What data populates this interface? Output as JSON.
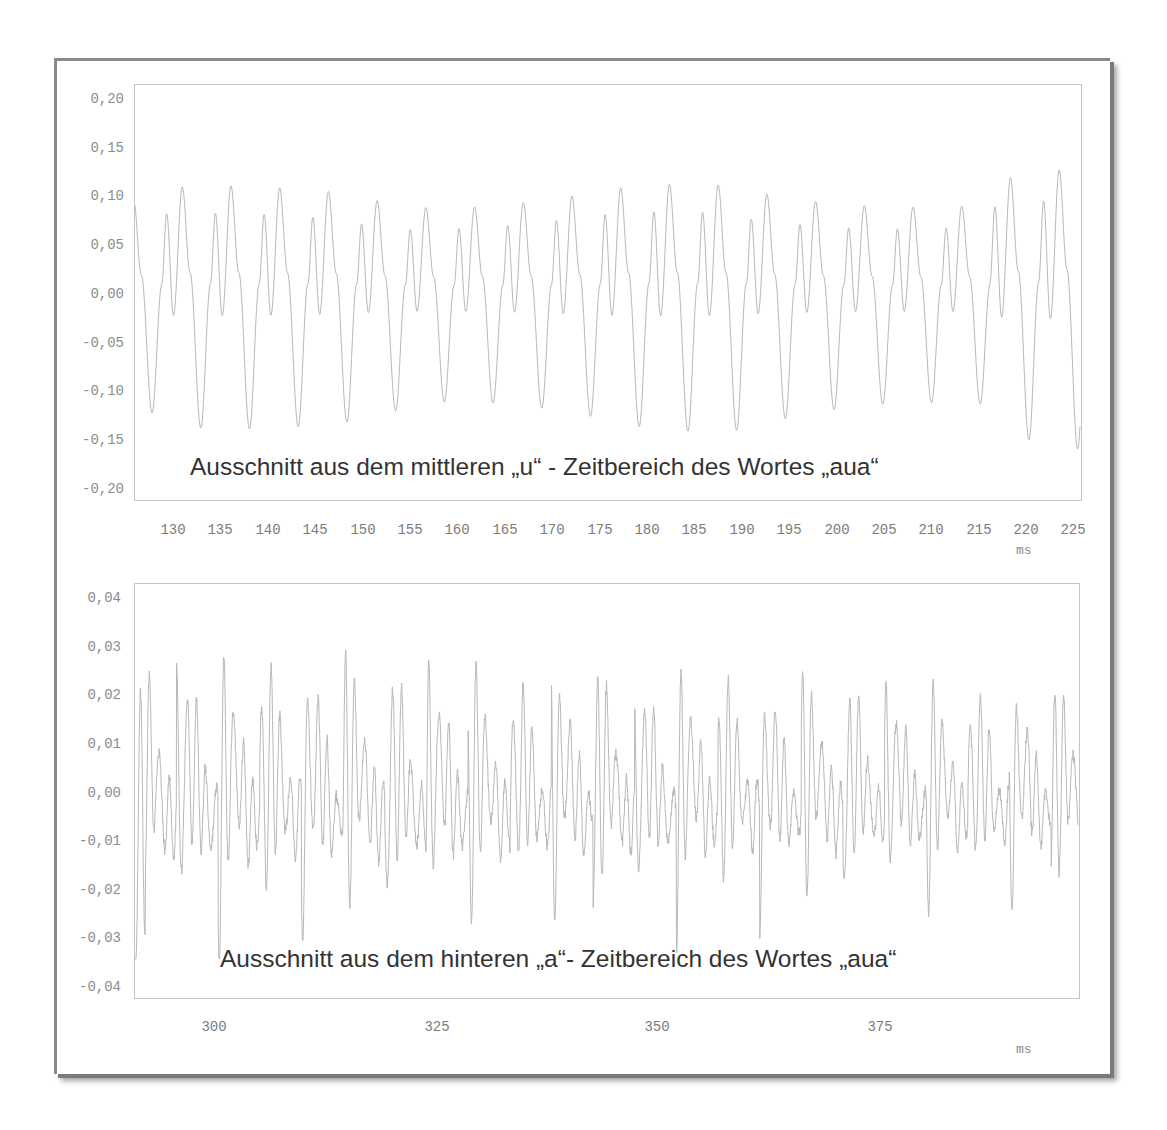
{
  "chart_data": [
    {
      "type": "line",
      "title": "Ausschnitt aus dem mittleren „u“ - Zeitbereich des Wortes „aua“",
      "xlabel": "ms",
      "ylabel": "",
      "xlim": [
        125.9,
        225.8
      ],
      "ylim": [
        -0.2,
        0.2
      ],
      "grid": false,
      "legend": "none",
      "x_ticks": [
        130,
        135,
        140,
        145,
        150,
        155,
        160,
        165,
        170,
        175,
        180,
        185,
        190,
        195,
        200,
        205,
        210,
        215,
        220,
        225
      ],
      "y_ticks": [
        0.2,
        0.15,
        0.1,
        0.05,
        0.0,
        -0.05,
        -0.1,
        -0.15,
        -0.2
      ],
      "y_tick_labels": [
        "0,20",
        "0,15",
        "0,10",
        "0,05",
        "0,00",
        "-0,05",
        "-0,10",
        "-0,15",
        "-0,20"
      ],
      "x_tick_labels": [
        "130",
        "135",
        "140",
        "145",
        "150",
        "155",
        "160",
        "165",
        "170",
        "175",
        "180",
        "185",
        "190",
        "195",
        "200",
        "205",
        "210",
        "215",
        "220",
        "225"
      ],
      "series": [
        {
          "name": "u-waveform",
          "description": "periodic vowel waveform, ~5.1 ms period (~195 Hz); per period: small peak ~0.075, large peak ~0.10, shallow dip ~-0.02, deep trough ~-0.125",
          "period_ms": 5.15,
          "small_peak": 0.075,
          "large_peak": 0.1,
          "shallow_dip": -0.02,
          "deep_trough": -0.125,
          "peak_range": [
            0.07,
            0.13
          ],
          "trough_range": [
            -0.16,
            -0.1
          ],
          "color": "#b8b8b8"
        }
      ]
    },
    {
      "type": "line",
      "title": "Ausschnitt aus dem hinteren „a“- Zeitbereich des Wortes „aua“",
      "xlabel": "ms",
      "ylabel": "",
      "xlim": [
        290.8,
        399.5
      ],
      "ylim": [
        -0.04,
        0.04
      ],
      "grid": false,
      "legend": "none",
      "x_ticks": [
        300,
        325,
        350,
        375
      ],
      "x_tick_labels": [
        "300",
        "325",
        "350",
        "375"
      ],
      "y_ticks": [
        0.04,
        0.03,
        0.02,
        0.01,
        0.0,
        -0.01,
        -0.02,
        -0.03,
        -0.04
      ],
      "y_tick_labels": [
        "0,04",
        "0,03",
        "0,02",
        "0,01",
        "0,00",
        "-0,01",
        "-0,02",
        "-0,03",
        "-0,04"
      ],
      "series": [
        {
          "name": "a-waveform",
          "description": "dense periodic vowel waveform, ~4.8 ms fundamental period (~207 Hz) with strong high-frequency formant oscillations (~900 Hz); peaks ~0.02–0.035, troughs ~-0.015 to -0.033",
          "period_ms": 4.8,
          "formant_hz": 900,
          "peak_range": [
            0.018,
            0.035
          ],
          "trough_range": [
            -0.033,
            -0.012
          ],
          "color": "#b8b8b8"
        }
      ]
    }
  ],
  "charts": {
    "top": {
      "caption": "Ausschnitt aus dem mittleren „u“ - Zeitbereich des Wortes „aua“",
      "unit": "ms",
      "y_labels": [
        "0,20",
        "0,15",
        "0,10",
        "0,05",
        "0,00",
        "-0,05",
        "-0,10",
        "-0,15",
        "-0,20"
      ],
      "x_labels": [
        "130",
        "135",
        "140",
        "145",
        "150",
        "155",
        "160",
        "165",
        "170",
        "175",
        "180",
        "185",
        "190",
        "195",
        "200",
        "205",
        "210",
        "215",
        "220",
        "225"
      ]
    },
    "bottom": {
      "caption": "Ausschnitt aus dem hinteren „a“- Zeitbereich des Wortes „aua“",
      "unit": "ms",
      "y_labels": [
        "0,04",
        "0,03",
        "0,02",
        "0,01",
        "0,00",
        "-0,01",
        "-0,02",
        "-0,03",
        "-0,04"
      ],
      "x_labels": [
        "300",
        "325",
        "350",
        "375"
      ]
    }
  },
  "colors": {
    "waveform": "#b8b8b8",
    "axis_text": "#8c8c8c",
    "caption_text": "#333333",
    "frame": "#8a8a8a",
    "plot_border": "#c4c4c4"
  }
}
